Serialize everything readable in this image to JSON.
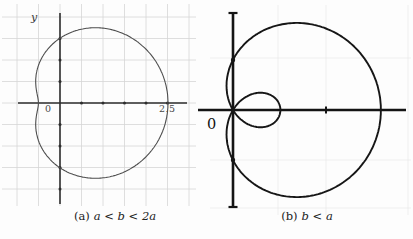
{
  "panels": [
    {
      "y_axis_label": "y",
      "origin_label": "0",
      "x_tick_label": "2.5",
      "caption_prefix": "(a)",
      "caption_math": "a < b < 2a"
    },
    {
      "origin_label": "0",
      "caption_prefix": "(b)",
      "caption_math": "b < a"
    }
  ],
  "chart_data": [
    {
      "type": "line",
      "subtype": "polar-limacon-dimpled",
      "title": "(a) a < b < 2a",
      "equation": "r = b + a cos(theta), a < b < 2a",
      "params": {
        "a": 1.0,
        "b": 1.5
      },
      "x_intercepts": [
        2.5,
        -0.5
      ],
      "y_intercepts": [
        1.5,
        -1.5
      ],
      "axis_tick_step": 0.5,
      "x_tick_labels": [
        "0",
        "2.5"
      ],
      "y_axis_title": "y",
      "grid": true,
      "render": {
        "cx": 60,
        "cy": 103,
        "unit": 43.2,
        "curve_color": "#4d4d4d",
        "curve_width": 1.1,
        "axis_color": "#2e2e2e",
        "axis_width": 1.6,
        "grid_color": "#d6d6d6",
        "grid_width": 0.8,
        "grid_x": [
          17,
          38.5,
          60,
          81.5,
          103,
          124.5,
          146,
          167.5,
          189
        ],
        "grid_y": [
          17,
          38.5,
          60,
          81.5,
          103,
          124.5,
          146,
          167.5,
          189
        ],
        "grid_y_extent": [
          4,
          206
        ],
        "grid_x_extent": [
          2,
          196
        ],
        "x_axis": [
          18,
          187
        ],
        "y_axis": [
          13,
          204
        ],
        "dot_ticks_x": [
          81.5,
          103,
          124.5,
          146,
          167.5
        ],
        "dot_ticks_y": [
          38.5,
          60,
          81.5,
          124.5,
          146,
          167.5,
          189
        ],
        "dot_r": 1.5,
        "caps": false
      }
    },
    {
      "type": "line",
      "subtype": "polar-limacon-inner-loop",
      "title": "(b) b < a",
      "equation": "r = b + a cos(theta), b < a",
      "params": {
        "a": 1.05,
        "b": 0.54
      },
      "x_intercepts": [
        1.59,
        0.51
      ],
      "y_intercepts": [
        0.54,
        -0.54
      ],
      "x_tick_labels": [
        "0"
      ],
      "grid": true,
      "render": {
        "cx": 233,
        "cy": 110,
        "unit": 93,
        "curve_color": "#161616",
        "curve_width": 1.9,
        "axis_color": "#141414",
        "axis_width": 2.6,
        "grid_color": "#ebebeb",
        "grid_width": 0.8,
        "grid_x": [
          278,
          326,
          408
        ],
        "grid_y": [
          58,
          160,
          208
        ],
        "grid_y_extent": [
          5,
          215
        ],
        "grid_x_extent": [
          210,
          411
        ],
        "x_axis": [
          198,
          406
        ],
        "y_axis": [
          13,
          207
        ],
        "caps": true,
        "cap_halfwidth": 4.5,
        "cap_width": 2.2,
        "dot_points": [
          [
            233,
            60
          ],
          [
            233,
            160
          ]
        ],
        "dot_point_r": 2.2,
        "dash_tick": {
          "x": 326,
          "y": 110,
          "h": 7,
          "w": 2
        }
      }
    }
  ]
}
